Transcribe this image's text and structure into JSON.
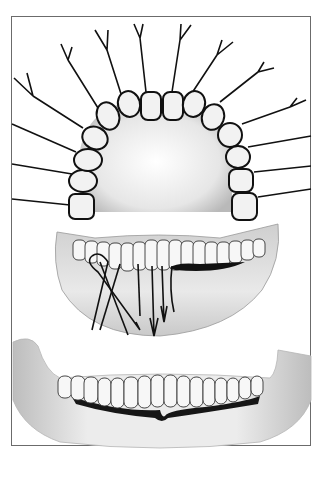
{
  "figure": {
    "panels": [
      {
        "id": "upper-arch",
        "content": "Maxillary dental arch, occlusal view, with nerve branches radiating from each tooth"
      },
      {
        "id": "lower-jaw-nerves",
        "content": "Mandibular teeth with nerve fibers descending into the jaw"
      },
      {
        "id": "mandible-gingiva",
        "content": "Mandible with lower teeth and a dark gingival line"
      }
    ],
    "colors": {
      "frame": "#6b6b6b",
      "outline": "#111111",
      "tooth_fill": "#f2f2f2",
      "bone_fill": "#d9d9d9",
      "gum_line": "#1a1a1a"
    }
  }
}
